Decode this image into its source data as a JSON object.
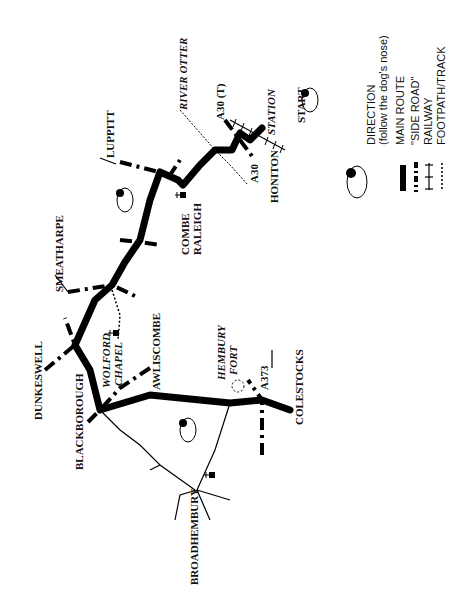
{
  "map": {
    "orientation": "rotated 90 degrees counter-clockwise",
    "places": {
      "start": "START",
      "station": "STATION",
      "honiton": "HONITON",
      "a30": "A30",
      "a30t": "A30 (T)",
      "river_otter": "RIVER OTTER",
      "luppitt": "LUPPITT",
      "combe_raleigh_1": "COMBE",
      "combe_raleigh_2": "RALEIGH",
      "smeatharpe": "SMEATHARPE",
      "dunkeswell": "DUNKESWELL",
      "wolford_chapel_1": "WOLFORD",
      "wolford_chapel_2": "CHAPEL",
      "awliscombe": "AWLISCOMBE",
      "blackborough": "BLACKBOROUGH",
      "broadhembury": "BROADHEMBURY",
      "hembury_fort_1": "HEMBURY",
      "hembury_fort_2": "FORT",
      "a373": "A373",
      "colestocks": "COLESTOCKS"
    },
    "legend": {
      "direction": "DIRECTION",
      "direction_note": "(follow the dog's nose)",
      "main_route": "MAIN ROUTE",
      "side_road": "\"SIDE ROAD\"",
      "railway": "RAILWAY",
      "footpath": "FOOTPATH/TRACK"
    },
    "colors": {
      "ink": "#000000",
      "paper": "#ffffff"
    }
  }
}
